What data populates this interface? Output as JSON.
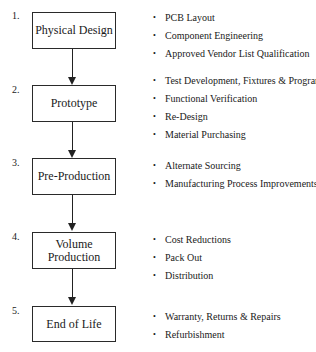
{
  "diagram": {
    "type": "flowchart",
    "stages": [
      {
        "number": "1.",
        "label": "Physical Design",
        "bullets": [
          "PCB Layout",
          "Component Engineering",
          "Approved Vendor List Qualification"
        ]
      },
      {
        "number": "2.",
        "label": "Prototype",
        "bullets": [
          "Test Development, Fixtures & Programs",
          "Functional Verification",
          "Re-Design",
          "Material Purchasing"
        ]
      },
      {
        "number": "3.",
        "label": "Pre-Production",
        "bullets": [
          "Alternate Sourcing",
          "Manufacturing Process Improvements"
        ]
      },
      {
        "number": "4.",
        "label_line1": "Volume",
        "label_line2": "Production",
        "bullets": [
          "Cost Reductions",
          "Pack Out",
          "Distribution"
        ]
      },
      {
        "number": "5.",
        "label": "End of Life",
        "bullets": [
          "Warranty, Returns & Repairs",
          "Refurbishment"
        ]
      }
    ],
    "bullet_glyph": "•",
    "colors": {
      "line": "#222222",
      "text": "#1a1a1a",
      "background": "#ffffff"
    }
  }
}
